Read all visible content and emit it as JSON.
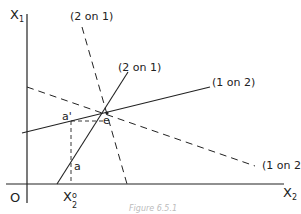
{
  "diagram": {
    "axes": {
      "y_label": "X",
      "y_sub": "1",
      "x_label": "X",
      "x_sub": "2",
      "origin": "O"
    },
    "curves": [
      {
        "id": "2on1-dashed",
        "label": "(2 on 1)",
        "style": "dashed"
      },
      {
        "id": "2on1-solid",
        "label": "(2 on 1)",
        "style": "solid"
      },
      {
        "id": "1on2-solid",
        "label": "(1 on 2)",
        "style": "solid"
      },
      {
        "id": "1on2-dashed",
        "label": "(1 on 2)",
        "style": "dashed"
      }
    ],
    "points": {
      "a_prime": "a'",
      "e": "e",
      "a": "a",
      "x2_zero_base": "X",
      "x2_zero_sub": "2",
      "x2_zero_sup": "o"
    },
    "caption": "Figure 6.5.1",
    "colors": {
      "ink": "#222222",
      "background": "#ffffff"
    }
  }
}
